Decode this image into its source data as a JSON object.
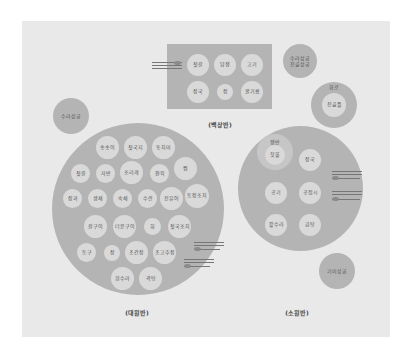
{
  "diagram": {
    "tables": {
      "baeksang": {
        "label": "(백상반)",
        "dishes": [
          "젓갈",
          "담쟁",
          "고기",
          "장국",
          "장",
          "꿀기름"
        ]
      },
      "daewonban": {
        "label": "(대원반)",
        "dishes": [
          "송송이",
          "젓국지",
          "동치미",
          "젓갈",
          "자반",
          "조리개",
          "편육",
          "찜",
          "장과",
          "생채",
          "숙채",
          "수란",
          "전유어",
          "토장조치",
          "갈구이",
          "더운구이",
          "회",
          "젓국조치",
          "토구",
          "장",
          "초간장",
          "초고추장",
          "흰수라",
          "곽탕"
        ]
      },
      "sowonban": {
        "label": "(소원반)",
        "inner_group_label": "쟁반",
        "dishes": [
          "찻물",
          "장국",
          "공기",
          "공접시",
          "팥수라",
          "곰탕"
        ]
      }
    },
    "side_items": {
      "top_right": "수라상궁\n전골상궁",
      "left": "수라상궁",
      "bottom_right": "기미상궁",
      "brazier_label": "화로",
      "brazier_inner": "전골틀"
    },
    "colors": {
      "background": "#e9e9e9",
      "table": "#b4b4b4",
      "dish": "#d9d9d9",
      "text": "#555555"
    }
  }
}
